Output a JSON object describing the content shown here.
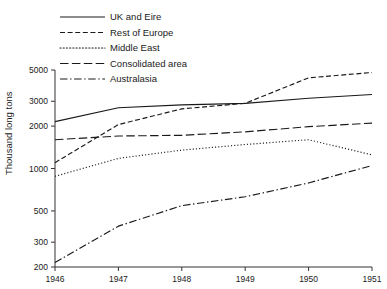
{
  "chart_data": {
    "type": "line",
    "title": "",
    "subtitle": "",
    "xlabel": "",
    "ylabel": "Thousand long tons",
    "yscale": "log",
    "ylim": [
      200,
      5000
    ],
    "xlim": [
      1946,
      1951
    ],
    "grid": false,
    "legend_position": "top-left",
    "x": [
      1946,
      1947,
      1948,
      1949,
      1950,
      1951
    ],
    "xtick_labels": [
      "1946",
      "1947",
      "1948",
      "1949",
      "1950",
      "1951"
    ],
    "ytick_values": [
      200,
      300,
      500,
      1000,
      2000,
      3000,
      5000
    ],
    "ytick_labels": [
      "200",
      "300",
      "500",
      "1000",
      "2000",
      "3000",
      "5000"
    ],
    "series": [
      {
        "name": "UK and Eire",
        "dash": "solid",
        "values": [
          2150,
          2700,
          2830,
          2900,
          3150,
          3350
        ]
      },
      {
        "name": "Rest of Europe",
        "dash": "dashed",
        "values": [
          1100,
          2050,
          2650,
          2900,
          4400,
          4800
        ]
      },
      {
        "name": "Middle East",
        "dash": "dotted",
        "values": [
          880,
          1180,
          1350,
          1480,
          1600,
          1250
        ]
      },
      {
        "name": "Consolidated area",
        "dash": "long-dashed",
        "values": [
          1600,
          1700,
          1720,
          1820,
          1980,
          2100
        ]
      },
      {
        "name": "Australasia",
        "dash": "dash-dot",
        "values": [
          215,
          390,
          545,
          630,
          790,
          1050
        ]
      }
    ]
  },
  "legend": {
    "items": [
      {
        "label": "UK and Eire",
        "dash": "solid"
      },
      {
        "label": "Rest of Europe",
        "dash": "dashed"
      },
      {
        "label": "Middle East",
        "dash": "dotted"
      },
      {
        "label": "Consolidated area",
        "dash": "long-dashed"
      },
      {
        "label": "Australasia",
        "dash": "dash-dot"
      }
    ]
  },
  "axes": {
    "ylabel": "Thousand long tons"
  },
  "colors": {
    "ink": "#1a1a1a",
    "axis": "#333333",
    "background": "#ffffff"
  }
}
